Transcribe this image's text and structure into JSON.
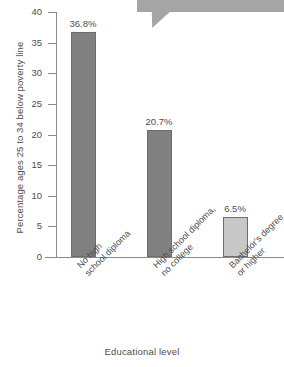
{
  "chart_data": {
    "type": "bar",
    "title": "",
    "subtitle": "",
    "categories": [
      "No high\nschool diploma",
      "High school diploma,\nno college",
      "Bachelor's degree\nor higher"
    ],
    "category_lines": [
      [
        "No high",
        "school diploma"
      ],
      [
        "High school diploma,",
        "no college"
      ],
      [
        "Bachelor's degree",
        "or higher"
      ]
    ],
    "values": [
      36.8,
      20.7,
      6.5
    ],
    "data_labels": [
      "36.8%",
      "20.7%",
      "6.5%"
    ],
    "xlabel": "Educational level",
    "ylabel": "Percentage ages 25 to 34 below poverty line",
    "ylim": [
      0,
      40
    ],
    "ytick_values": [
      0,
      5,
      10,
      15,
      20,
      25,
      30,
      35,
      40
    ],
    "ytick_labels": [
      "0",
      "5",
      "10",
      "15",
      "20",
      "25",
      "30",
      "35",
      "40"
    ],
    "grid": false,
    "legend": false,
    "bar_colors": [
      "#808080",
      "#808080",
      "#c8c8c8"
    ],
    "bar_border_color": "#6d6d6d",
    "axis_color": "#8a8a8a",
    "text_color": "#4d4d4d",
    "background_color": "#ffffff"
  },
  "annotations": {
    "callout": {
      "shape": "speech-bubble",
      "color": "#a5a5a5",
      "text": ""
    }
  }
}
